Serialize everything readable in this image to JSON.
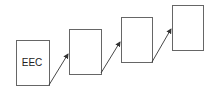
{
  "diagram": {
    "boxes": [
      {
        "label": "EEC",
        "x": 16,
        "y": 40,
        "w": 33,
        "h": 45
      },
      {
        "label": "",
        "x": 69,
        "y": 29,
        "w": 32,
        "h": 45
      },
      {
        "label": "",
        "x": 121,
        "y": 17,
        "w": 31,
        "h": 45
      },
      {
        "label": "",
        "x": 172,
        "y": 5,
        "w": 31,
        "h": 45
      }
    ],
    "arrows": [
      {
        "from": 0,
        "to": 1
      },
      {
        "from": 1,
        "to": 2
      },
      {
        "from": 2,
        "to": 3
      }
    ],
    "colors": {
      "stroke": "#555555",
      "arrow": "#333333"
    }
  }
}
